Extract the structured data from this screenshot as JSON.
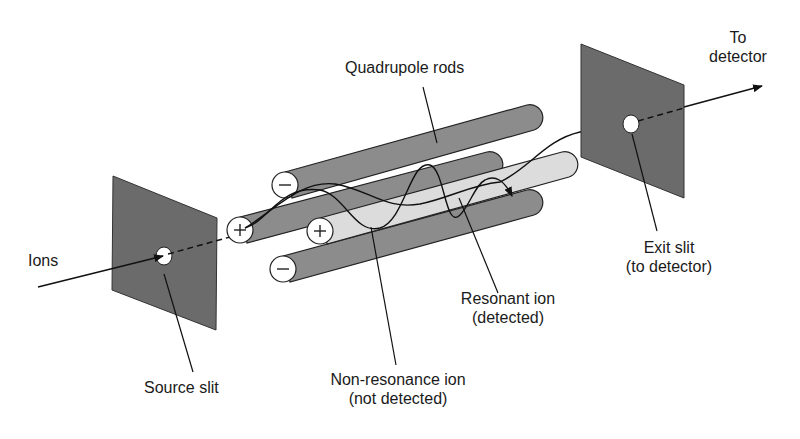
{
  "diagram": {
    "labels": {
      "ions": "Ions",
      "source_slit": "Source slit",
      "quadrupole_rods": "Quadrupole rods",
      "to_detector_line1": "To",
      "to_detector_line2": "detector",
      "exit_slit_line1": "Exit slit",
      "exit_slit_line2": "(to detector)",
      "resonant_ion_line1": "Resonant ion",
      "resonant_ion_line2": "(detected)",
      "non_resonance_line1": "Non-resonance ion",
      "non_resonance_line2": "(not detected)"
    },
    "rod_polarities": {
      "top": "−",
      "middle_back": "+",
      "middle_front": "+",
      "bottom": "−"
    },
    "colors": {
      "plate": "#6b6b6b",
      "rod_dark": "#8c8c8c",
      "rod_light": "#dcdcdc",
      "line": "#111111"
    }
  }
}
